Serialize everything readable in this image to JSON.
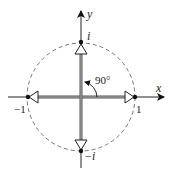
{
  "diagram": {
    "axes": {
      "x_label": "x",
      "y_label": "y"
    },
    "unit_circle": {
      "style": "dashed",
      "radius_px": 53
    },
    "points": [
      {
        "id": "one",
        "label": "1"
      },
      {
        "id": "i",
        "label": "i"
      },
      {
        "id": "neg_one",
        "label": "−1"
      },
      {
        "id": "neg_i",
        "label": "−i"
      }
    ],
    "angle": {
      "label": "90°"
    },
    "colors": {
      "stroke": "#222222",
      "circle": "#666666",
      "vector": "#444444",
      "background": "#ffffff"
    }
  }
}
